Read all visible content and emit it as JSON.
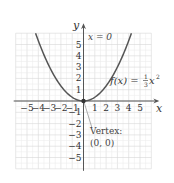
{
  "chart_data": {
    "type": "line",
    "title": "",
    "function": "f(x) = (1/3)x^2",
    "xlabel": "x",
    "ylabel": "y",
    "xlim": [
      -6,
      6
    ],
    "ylim": [
      -6,
      6
    ],
    "grid": true,
    "x_ticks": [
      -5,
      -4,
      -3,
      -2,
      -1,
      1,
      2,
      3,
      4,
      5
    ],
    "y_ticks": [
      -5,
      -4,
      -3,
      -2,
      -1,
      1,
      2,
      3,
      4,
      5
    ],
    "x_tick_labels": [
      "−5",
      "−4",
      "−3",
      "−2",
      "−1",
      "1",
      "2",
      "3",
      "4",
      "5"
    ],
    "y_tick_labels": [
      "−5",
      "−4",
      "−3",
      "−2",
      "−1",
      "1",
      "2",
      "3",
      "4",
      "5"
    ],
    "series": [
      {
        "name": "f(x) = 1/3 x^2",
        "x": [
          -4.24,
          -4,
          -3,
          -2,
          -1,
          0,
          1,
          2,
          3,
          4,
          4.24
        ],
        "y": [
          6,
          5.33,
          3,
          1.33,
          0.33,
          0,
          0.33,
          1.33,
          3,
          5.33,
          6
        ]
      }
    ],
    "annotations": [
      {
        "text": "x = 0",
        "position": "near top of y-axis",
        "meaning": "axis of symmetry"
      },
      {
        "text": "Vertex:",
        "line2": "(0, 0)",
        "points_to": [
          0,
          0
        ]
      }
    ],
    "vertex": [
      0,
      0
    ]
  },
  "labels": {
    "x_axis": "x",
    "y_axis": "y",
    "symmetry": "x = 0",
    "fn_prefix": "f(x) = ",
    "fn_num": "1",
    "fn_den": "3",
    "fn_var": "x",
    "fn_exp": "2",
    "vertex_line1": "Vertex:",
    "vertex_line2": "(0, 0)"
  },
  "colors": {
    "curve": "#555555",
    "grid": "#dddddd",
    "axis": "#555555",
    "text": "#333333"
  }
}
